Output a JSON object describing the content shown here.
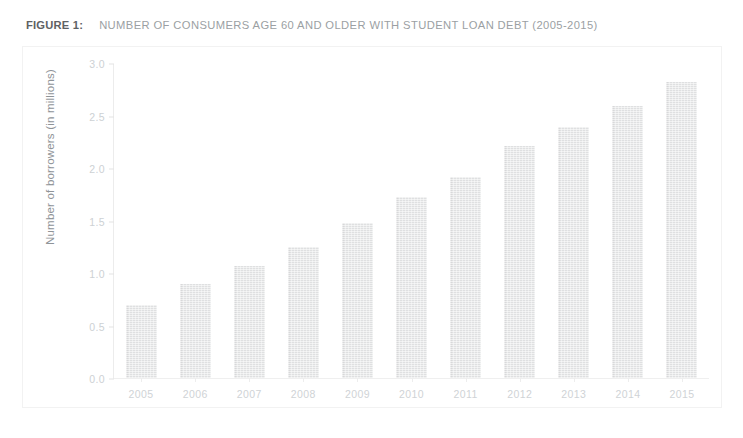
{
  "caption": {
    "label": "FIGURE 1:",
    "title": "NUMBER OF CONSUMERS AGE 60 AND OLDER WITH STUDENT LOAN DEBT (2005-2015)"
  },
  "colors": {
    "bar_fill": "#dfe0e1",
    "axis_line": "#ececec",
    "tick_text": "#cdd1d4",
    "caption_label": "#5e6164",
    "caption_title": "#9b9fa3",
    "frame_border": "#f2f2f2"
  },
  "chart_data": {
    "type": "bar",
    "title": "NUMBER OF CONSUMERS AGE 60 AND OLDER WITH STUDENT LOAN DEBT (2005-2015)",
    "xlabel": "",
    "ylabel": "Number of borrowers (in millions)",
    "categories": [
      "2005",
      "2006",
      "2007",
      "2008",
      "2009",
      "2010",
      "2011",
      "2012",
      "2013",
      "2014",
      "2015"
    ],
    "values": [
      0.7,
      0.9,
      1.07,
      1.25,
      1.48,
      1.73,
      1.92,
      2.22,
      2.4,
      2.6,
      2.83
    ],
    "ylim": [
      0.0,
      3.0
    ],
    "yticks": [
      0.0,
      0.5,
      1.0,
      1.5,
      2.0,
      2.5,
      3.0
    ],
    "ytick_labels": [
      "0.0",
      "0.5",
      "1.0",
      "1.5",
      "2.0",
      "2.5",
      "3.0"
    ],
    "grid": false,
    "legend": null,
    "legend_position": "none"
  }
}
